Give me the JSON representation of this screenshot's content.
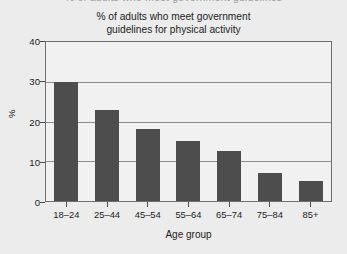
{
  "clipped_top_text": "% of adults who meet government guidelines",
  "chart_data": {
    "type": "bar",
    "title": "% of adults who meet government guidelines for physical activity",
    "title_lines": [
      "% of adults who meet government",
      "guidelines for physical activity"
    ],
    "xlabel": "Age group",
    "ylabel": "%",
    "categories": [
      "18–24",
      "25–44",
      "45–54",
      "55–64",
      "65–74",
      "75–84",
      "85+"
    ],
    "values": [
      30,
      23,
      18,
      15,
      12.5,
      7,
      5
    ],
    "ylim": [
      0,
      40
    ],
    "yticks": [
      0,
      10,
      20,
      30,
      40
    ],
    "ytick_labels": [
      "0",
      "10",
      "20",
      "30",
      "40"
    ],
    "gridlines": [
      10,
      20,
      30
    ],
    "grid": true,
    "legend": null,
    "bar_color": "#4d4d4d",
    "background_color": "#ececec",
    "plot_background_color": "#f1f1f1",
    "axis_color": "#6f6f6f",
    "gridline_color": "#8d8d8d"
  }
}
